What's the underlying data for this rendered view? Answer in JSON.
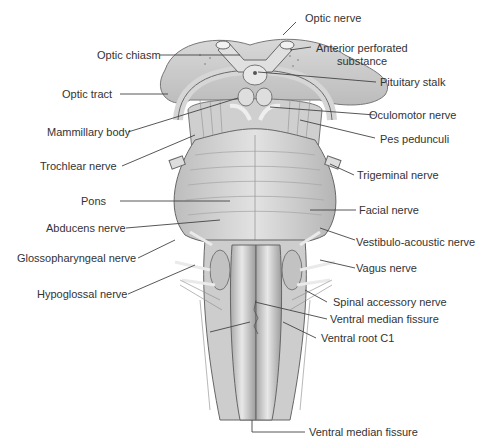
{
  "figure": {
    "labels": {
      "optic_nerve": "Optic nerve",
      "optic_chiasm": "Optic chiasm",
      "anterior_perforated_1": "Anterior perforated",
      "anterior_perforated_2": "substance",
      "pituitary_stalk": "Pituitary stalk",
      "optic_tract": "Optic tract",
      "oculomotor_nerve": "Oculomotor nerve",
      "mammillary_body": "Mammillary body",
      "pes_pedunculi": "Pes pedunculi",
      "trochlear_nerve": "Trochlear nerve",
      "trigeminal_nerve": "Trigeminal nerve",
      "pons": "Pons",
      "facial_nerve": "Facial nerve",
      "abducens_nerve": "Abducens nerve",
      "vestibulo_acoustic_nerve": "Vestibulo-acoustic nerve",
      "glossopharyngeal_nerve": "Glossopharyngeal nerve",
      "vagus_nerve": "Vagus nerve",
      "hypoglossal_nerve": "Hypoglossal nerve",
      "spinal_accessory_nerve": "Spinal accessory nerve",
      "ventral_median_fissure_upper": "Ventral median fissure",
      "ventral_root_c1": "Ventral root C1",
      "ventral_median_fissure_lower": "Ventral median fissure"
    },
    "colors": {
      "tissue_light": "#e6e6e6",
      "tissue_mid": "#c8c8c8",
      "tissue_dark": "#8a8a8a",
      "outline": "#555555",
      "leader": "#444444",
      "text": "#333333"
    }
  }
}
